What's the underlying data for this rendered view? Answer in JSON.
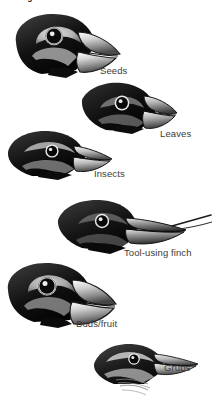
{
  "figure": {
    "title_partial": "eating different foods",
    "background_color": "#ffffff",
    "ink_color": "#1a1a1a",
    "label_color": "#3a3a3a",
    "width": 212,
    "height": 396
  },
  "birds": [
    {
      "id": "seeds",
      "label": "Seeds",
      "beak": "large deep conical crushing beak",
      "order": 1
    },
    {
      "id": "leaves",
      "label": "Leaves",
      "beak": "short stout conical beak",
      "order": 2
    },
    {
      "id": "insects",
      "label": "Insects",
      "beak": "medium pointed tapered beak",
      "order": 3
    },
    {
      "id": "tool-using-finch",
      "label": "Tool-using finch",
      "beak": "long straight probing beak holding cactus spine",
      "order": 4
    },
    {
      "id": "buds-fruit",
      "label": "Buds/fruit",
      "beak": "very large parrot-like hooked beak",
      "order": 5
    },
    {
      "id": "grubs",
      "label": "Grubs",
      "beak": "slender warbler-like thin beak",
      "order": 6
    }
  ]
}
